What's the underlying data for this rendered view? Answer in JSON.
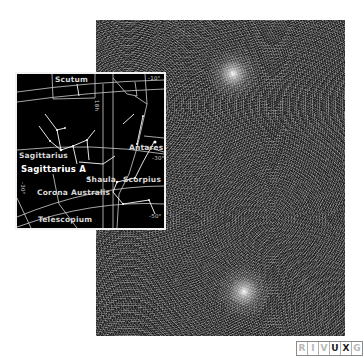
{
  "photo": {
    "description": "X-ray image of the Galactic center region",
    "sources": [
      {
        "name": "upper-bright-source",
        "x_pct": 55,
        "y_pct": 17
      },
      {
        "name": "lower-bright-source",
        "x_pct": 59.5,
        "y_pct": 86
      }
    ]
  },
  "finder_chart": {
    "constellations": {
      "scutum": "Scutum",
      "sagittarius": "Sagittarius",
      "scorpius": "Scorpius",
      "corona_australis": "Corona Australis",
      "telescopium": "Telescopium"
    },
    "objects": {
      "sagittarius_a": "Sagittarius A",
      "shaula": "Shaula",
      "antares": "Antares"
    },
    "grid_labels": {
      "ra_18h": "18h",
      "dec_minus10": "-10°",
      "dec_minus30": "-30°",
      "dec_minus50": "-50°",
      "dec_minus30_left": "-30°"
    }
  },
  "wavelength_badge": {
    "letters": [
      {
        "letter": "R",
        "active": false
      },
      {
        "letter": "I",
        "active": false
      },
      {
        "letter": "V",
        "active": false
      },
      {
        "letter": "U",
        "active": true
      },
      {
        "letter": "X",
        "active": true
      },
      {
        "letter": "G",
        "active": false
      }
    ],
    "colors": {
      "active": "#1a1a1a",
      "inactive": "#b8b8b8"
    }
  }
}
